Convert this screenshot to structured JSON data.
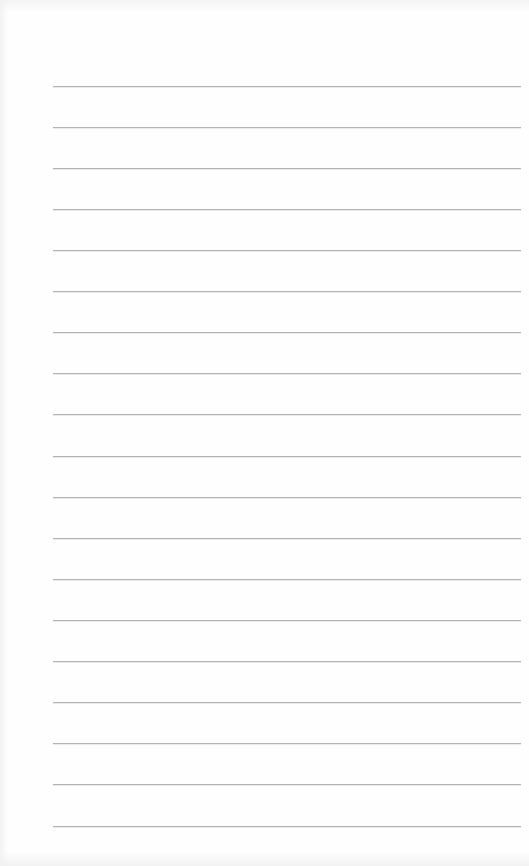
{
  "page": {
    "type": "lined-paper",
    "background_color": "#fefefe",
    "rule_color": "#b3b3b3",
    "rule_count": 19,
    "rule_left": 53,
    "rule_right": 521,
    "rules_y": [
      86,
      127,
      168,
      209,
      250,
      291,
      332,
      373,
      414,
      456,
      497,
      538,
      579,
      620,
      661,
      702,
      743,
      784,
      826
    ]
  }
}
